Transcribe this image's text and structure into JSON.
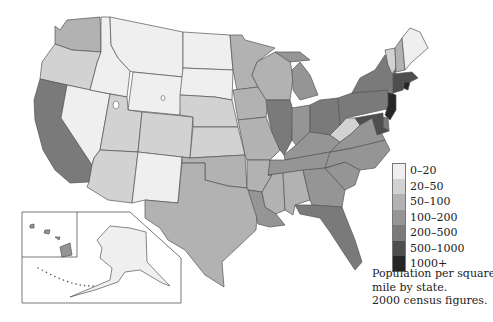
{
  "legend": {
    "classes": [
      {
        "label": "0–20",
        "color": "#efefef"
      },
      {
        "label": "20–50",
        "color": "#d2d2d2"
      },
      {
        "label": "50–100",
        "color": "#b2b2b2"
      },
      {
        "label": "100–200",
        "color": "#959595"
      },
      {
        "label": "200–500",
        "color": "#7a7a7a"
      },
      {
        "label": "500–1000",
        "color": "#4e4e4e"
      },
      {
        "label": "1000+",
        "color": "#262626"
      }
    ]
  },
  "caption": {
    "line1": "Population per square",
    "line2": "mile by state.",
    "line3": "2000 census figures."
  },
  "chart_data": {
    "type": "choropleth",
    "title": "Population per square mile by state. 2000 census figures.",
    "bins": [
      "0–20",
      "20–50",
      "50–100",
      "100–200",
      "200–500",
      "500–1000",
      "1000+"
    ],
    "states": {
      "WA": "50–100",
      "OR": "20–50",
      "CA": "200–500",
      "NV": "0–20",
      "ID": "0–20",
      "MT": "0–20",
      "WY": "0–20",
      "UT": "20–50",
      "CO": "20–50",
      "AZ": "20–50",
      "NM": "0–20",
      "ND": "0–20",
      "SD": "0–20",
      "NE": "20–50",
      "KS": "20–50",
      "OK": "50–100",
      "TX": "50–100",
      "MN": "50–100",
      "IA": "50–100",
      "MO": "50–100",
      "AR": "50–100",
      "LA": "100–200",
      "WI": "50–100",
      "IL": "200–500",
      "MI": "100–200",
      "IN": "100–200",
      "OH": "200–500",
      "KY": "100–200",
      "TN": "100–200",
      "MS": "50–100",
      "AL": "50–100",
      "GA": "100–200",
      "FL": "200–500",
      "SC": "100–200",
      "NC": "100–200",
      "VA": "100–200",
      "WV": "20–50",
      "PA": "200–500",
      "NY": "200–500",
      "VT": "20–50",
      "NH": "50–100",
      "ME": "0–20",
      "MA": "500–1000",
      "RI": "1000+",
      "CT": "500–1000",
      "NJ": "1000+",
      "DE": "200–500",
      "MD": "500–1000",
      "AK": "0–20",
      "HI": "100–200"
    }
  }
}
